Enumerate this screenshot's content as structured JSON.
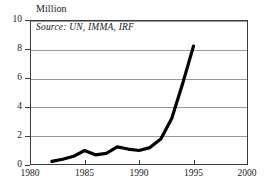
{
  "chart_data": {
    "type": "line",
    "title": "Million",
    "subtitle": "",
    "xlabel": "",
    "ylabel": "Million",
    "annotations": [
      "Source: UN, IMMA, IRF"
    ],
    "source_text": "Source: UN, IMMA, IRF",
    "grid": true,
    "legend": "none",
    "xlim": [
      1980,
      2000
    ],
    "ylim": [
      0,
      10
    ],
    "xticks": [
      "1980",
      "1985",
      "1990",
      "1995",
      "2000"
    ],
    "yticks": [
      "0",
      "2",
      "4",
      "6",
      "8",
      "10"
    ],
    "x": [
      1982,
      1983,
      1984,
      1985,
      1986,
      1987,
      1988,
      1989,
      1990,
      1991,
      1992,
      1993,
      1994,
      1995
    ],
    "values": [
      0.25,
      0.4,
      0.6,
      1.0,
      0.7,
      0.8,
      1.25,
      1.1,
      1.0,
      1.2,
      1.8,
      3.2,
      5.6,
      8.2
    ],
    "series": [
      {
        "name": "Motor vehicles",
        "color": "#000000",
        "values": [
          0.25,
          0.4,
          0.6,
          1.0,
          0.7,
          0.8,
          1.25,
          1.1,
          1.0,
          1.2,
          1.8,
          3.2,
          5.6,
          8.2
        ]
      }
    ]
  },
  "colors": {
    "line": "#000000",
    "frame": "#3b3b3b",
    "grid": "#9a9a9a",
    "text": "#1a1a1a",
    "background": "#ffffff"
  }
}
